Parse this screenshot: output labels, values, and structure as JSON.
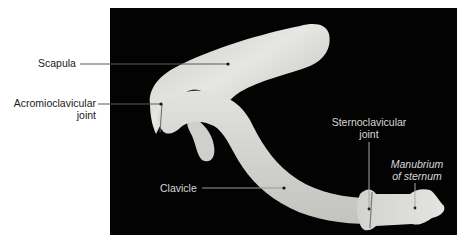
{
  "figure": {
    "background_color": "#ffffff",
    "photo_background_color": "#030303",
    "bone_color": "#d9d9d6",
    "labels": {
      "scapula": "Scapula",
      "acromioclavicular_line1": "Acromioclavicular",
      "acromioclavicular_line2": "joint",
      "clavicle": "Clavicle",
      "sternoclavicular_line1": "Sternoclavicular",
      "sternoclavicular_line2": "joint",
      "manubrium_line1": "Manubrium",
      "manubrium_line2": "of sternum"
    }
  }
}
